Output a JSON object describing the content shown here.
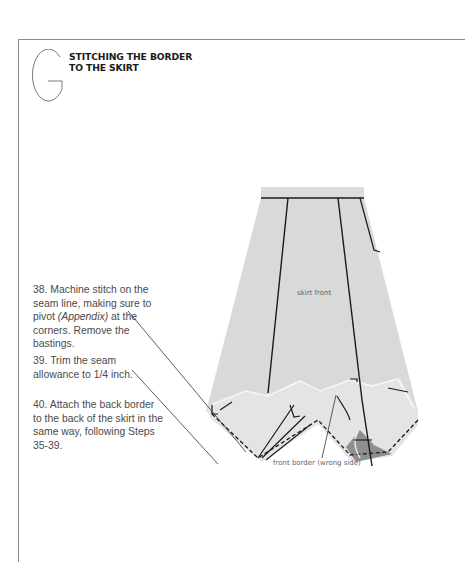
{
  "section": {
    "letter": "G",
    "title_line1": "STITCHING THE BORDER",
    "title_line2": "TO THE SKIRT"
  },
  "steps": [
    {
      "number": "38.",
      "text_before": "Machine stitch on the seam line, making sure to pivot ",
      "italic": "(Appendix)",
      "text_after": " at the corners. Remove the bastings."
    },
    {
      "number": "39.",
      "text": "Trim the seam allowance to 1/4 inch."
    },
    {
      "number": "40.",
      "text": "Attach the back border to the back of the skirt in the same way, following Steps 35-39."
    }
  ],
  "illustration": {
    "labels": {
      "skirt_front": "skirt front",
      "front_border": "front border (wrong side)"
    },
    "colors": {
      "fabric": "#d9d9d9",
      "border": "#e4e4e4",
      "shadow": "#8f8f8f",
      "stitch": "#1a1a1a"
    }
  }
}
